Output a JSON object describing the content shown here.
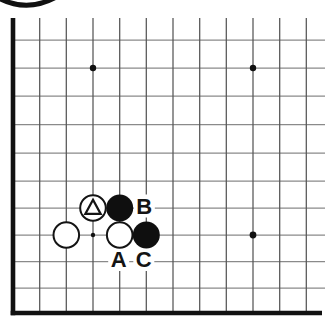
{
  "figure": {
    "type": "go-diagram",
    "background": "#ffffff",
    "badge": {
      "description": "bottom arc of circled figure-number badge cropped at top-left",
      "color": "#111111",
      "path": "M -3 -3 Q 27 14 58 -4",
      "stroke_width": 5
    },
    "board": {
      "cols": [
        13,
        39.7,
        66.3,
        93,
        119.7,
        146.3,
        173,
        199.7,
        226.3,
        253,
        279.7,
        306.3
      ],
      "rows": [
        40,
        68,
        96,
        124.5,
        153,
        181,
        208,
        235,
        261.5,
        288,
        313
      ],
      "top_stub_y": 18,
      "right_end_x": 325,
      "h_line_color": "#8a8a8a",
      "v_line_color": "#555555",
      "edge_color": "#111111",
      "edge_width": 4.6,
      "thin_width": 1.25,
      "stone_black": "#0f0f0f",
      "stone_white": "#ffffff",
      "stone_outline": "#141414",
      "stone_radius": 13.2,
      "stars": [
        {
          "col": 3,
          "row": 1,
          "r": 3.2
        },
        {
          "col": 9,
          "row": 1,
          "r": 3.2
        },
        {
          "col": 3,
          "row": 7,
          "r": 2.2
        },
        {
          "col": 9,
          "row": 7,
          "r": 3.4
        }
      ],
      "stones": [
        {
          "col": 3,
          "row": 6,
          "color": "white",
          "marker": "triangle"
        },
        {
          "col": 4,
          "row": 6,
          "color": "black"
        },
        {
          "col": 2,
          "row": 7,
          "color": "white"
        },
        {
          "col": 4,
          "row": 7,
          "color": "white"
        },
        {
          "col": 5,
          "row": 7,
          "color": "black"
        }
      ],
      "labels": [
        {
          "text": "B",
          "col": 5,
          "row": 6,
          "dx": -2,
          "dy": -2
        },
        {
          "text": "A",
          "col": 4,
          "row": 8,
          "dx": -1,
          "dy": -2
        },
        {
          "text": "C",
          "col": 5,
          "row": 8,
          "dx": -2.5,
          "dy": -2
        }
      ],
      "label_font_size": 22,
      "label_patch": {
        "w": 21,
        "h": 23
      }
    }
  }
}
